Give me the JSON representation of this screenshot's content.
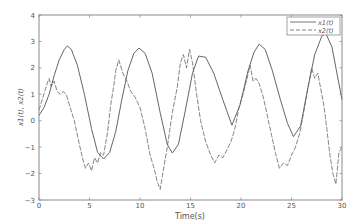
{
  "chart_data": {
    "type": "line",
    "title": "",
    "xlabel": "Time(s)",
    "ylabel": "x1(t), x2(t)",
    "xlim": [
      0,
      30
    ],
    "ylim": [
      -3,
      4
    ],
    "xticks": [
      0,
      5,
      10,
      15,
      20,
      25,
      30
    ],
    "yticks": [
      -3,
      -2,
      -1,
      0,
      1,
      2,
      3,
      4
    ],
    "grid": false,
    "legend_position": "upper right",
    "series": [
      {
        "name": "x1(t)",
        "style": "solid",
        "color": "#555555",
        "x": [
          0,
          0.5,
          1,
          1.5,
          2,
          2.5,
          2.8,
          3.2,
          3.8,
          4.5,
          5.2,
          5.8,
          6.4,
          7,
          7.6,
          8.2,
          8.8,
          9.4,
          9.9,
          10.5,
          11.2,
          12,
          12.7,
          13.2,
          13.8,
          14.5,
          15.2,
          15.8,
          16.5,
          17.3,
          18.2,
          19.1,
          19.9,
          20.7,
          21.3,
          21.8,
          22.4,
          23.1,
          23.9,
          24.6,
          25.2,
          25.9,
          26.6,
          27.3,
          28,
          28.4,
          29,
          29.5,
          30
        ],
        "y": [
          0.2,
          0.5,
          1.0,
          1.7,
          2.3,
          2.7,
          2.83,
          2.7,
          2.1,
          1.0,
          -0.3,
          -1.2,
          -1.45,
          -1.2,
          -0.4,
          0.8,
          1.9,
          2.55,
          2.75,
          2.55,
          1.8,
          0.3,
          -0.9,
          -1.22,
          -0.9,
          0.4,
          1.8,
          2.45,
          2.4,
          1.8,
          0.8,
          -0.17,
          0.6,
          1.9,
          2.6,
          2.9,
          2.7,
          1.9,
          0.8,
          -0.1,
          -0.6,
          -0.2,
          1.2,
          2.5,
          3.2,
          3.3,
          2.8,
          1.8,
          0.8
        ]
      },
      {
        "name": "x2(t)",
        "style": "dashed",
        "color": "#666666",
        "x": [
          0,
          0.4,
          0.8,
          1.0,
          1.2,
          1.5,
          1.8,
          2.1,
          2.4,
          2.7,
          3.0,
          3.5,
          4.0,
          4.3,
          4.6,
          4.9,
          5.2,
          5.5,
          5.8,
          6.1,
          6.4,
          6.8,
          7.1,
          7.4,
          7.6,
          7.9,
          8.3,
          8.7,
          9.1,
          9.5,
          10.0,
          10.5,
          11.0,
          11.4,
          11.7,
          12.0,
          12.3,
          12.7,
          13.2,
          13.7,
          14.0,
          14.3,
          14.6,
          14.9,
          15.2,
          15.6,
          16.0,
          16.5,
          17.0,
          17.4,
          17.8,
          18.2,
          18.6,
          19.0,
          19.4,
          19.8,
          20.2,
          20.6,
          20.9,
          21.2,
          21.5,
          21.8,
          22.2,
          22.6,
          23.0,
          23.4,
          23.8,
          24.2,
          24.6,
          25.0,
          25.4,
          25.8,
          26.2,
          26.6,
          27.0,
          27.3,
          27.6,
          27.9,
          28.2,
          28.5,
          28.8,
          29.1,
          29.4,
          29.7,
          30.0
        ],
        "y": [
          0.4,
          0.9,
          1.4,
          1.6,
          1.3,
          1.5,
          1.1,
          1.0,
          1.1,
          1.0,
          0.6,
          0.0,
          -0.9,
          -1.4,
          -1.8,
          -1.6,
          -1.9,
          -1.4,
          -1.6,
          -1.2,
          -1.3,
          -0.4,
          0.6,
          1.3,
          1.9,
          2.3,
          1.8,
          1.5,
          1.1,
          0.9,
          0.5,
          -0.3,
          -1.3,
          -1.8,
          -2.3,
          -2.6,
          -1.9,
          -1.0,
          0.3,
          1.3,
          2.2,
          2.5,
          2.0,
          2.7,
          2.2,
          1.0,
          0.0,
          -0.8,
          -1.3,
          -1.6,
          -1.3,
          -1.4,
          -1.1,
          -0.8,
          -0.3,
          0.5,
          1.0,
          1.6,
          2.1,
          1.5,
          1.6,
          1.4,
          0.9,
          0.2,
          -0.5,
          -1.2,
          -1.8,
          -1.6,
          -1.7,
          -1.3,
          -1.0,
          -0.5,
          0.3,
          1.2,
          2.0,
          1.6,
          1.8,
          1.2,
          0.6,
          -0.3,
          -1.3,
          -2.0,
          -2.4,
          -1.2,
          -1.0
        ]
      }
    ]
  },
  "legend": {
    "items": [
      {
        "label": "x1(t)",
        "style": "solid"
      },
      {
        "label": "x2(t)",
        "style": "dashed"
      }
    ]
  },
  "axes": {
    "xlabel": "Time(s)",
    "ylabel": "x1(t), x2(t)"
  }
}
